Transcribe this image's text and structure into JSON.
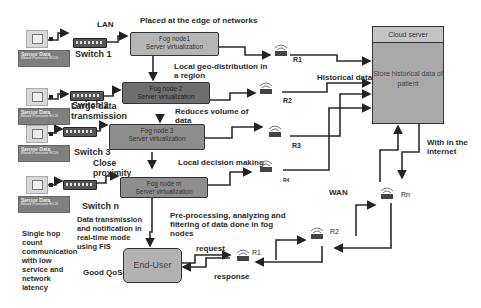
{
  "labels": {
    "lan": "LAN",
    "edge": "Placed at the edge of networks",
    "geo": "Local geo-distribution in a region",
    "reduces": "Reduces volume of data",
    "decision": "Local decision making",
    "preprocess": "Pre-processing, analyzing  and filtering  of data done in fog nodes",
    "historical": "Historical data",
    "internet": "With in the internet",
    "wan": "WAN",
    "request": "request",
    "response": "response",
    "large_data": "Large data transmission",
    "close": "Close proximity",
    "data_tx": "Data transmission and notification in real-time mode using FIS",
    "single_hop": "Single hop count communication with low service and network latency",
    "qos": "Good QoS"
  },
  "switches": [
    "Switch 1",
    "Switch 2",
    "Switch 3",
    "Switch n"
  ],
  "sensor_panel": {
    "title": "Sensor Data",
    "lines": [
      "Blood Pressure    ECG",
      "Body Temperature  Heart Rate",
      "Oxygen Saturation Glucose",
      "Sleep Monitoring"
    ]
  },
  "fog_nodes": [
    {
      "name": "Fog node1",
      "sub": "Server virtualization"
    },
    {
      "name": "Fog node 2",
      "sub": "Server virtualization"
    },
    {
      "name": "Fog node 3",
      "sub": "Server virtualization"
    },
    {
      "name": "Fog node m",
      "sub": "Server virtualization"
    }
  ],
  "routers": [
    "R1",
    "R2",
    "R3",
    "R4",
    "Rn",
    "R2",
    "R1"
  ],
  "cloud": {
    "title": "Cloud server",
    "body": "Store historical data of patient"
  },
  "end_user": "End-User"
}
